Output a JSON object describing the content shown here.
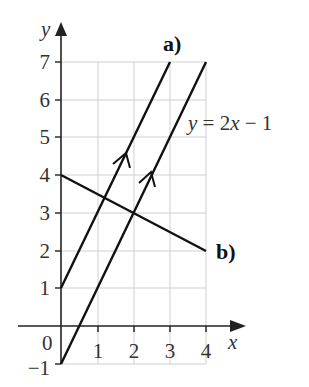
{
  "diagram": {
    "axes": {
      "x_label": "x",
      "y_label": "y",
      "origin_label": "0",
      "x_ticks": [
        "1",
        "2",
        "3",
        "4"
      ],
      "y_ticks": [
        "7",
        "6",
        "5",
        "4",
        "3",
        "2",
        "1",
        "−1"
      ],
      "x_range": [
        0,
        4
      ],
      "y_range": [
        -1,
        7
      ]
    },
    "lines": [
      {
        "id": "given",
        "equation_label": "y = 2x − 1",
        "equation_parts": {
          "y": "y",
          "rest": " = 2",
          "x": "x",
          "tail": " − 1"
        },
        "from": [
          0,
          -1
        ],
        "to": [
          4,
          7
        ],
        "arrow": true
      },
      {
        "id": "a",
        "label": "a)",
        "from": [
          0,
          1
        ],
        "to": [
          3,
          7
        ],
        "arrow": true
      },
      {
        "id": "b",
        "label": "b)",
        "from": [
          0,
          4
        ],
        "to": [
          4,
          2
        ],
        "arrow": false
      }
    ],
    "colors": {
      "line": "#111111",
      "grid": "#cfcfcf",
      "text": "#333333"
    }
  }
}
